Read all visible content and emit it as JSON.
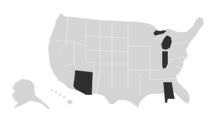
{
  "map": {
    "type": "US states choropleth",
    "colors": {
      "base": "#d4d4d4",
      "highlight": "#2f2f2f",
      "background": "#ffffff"
    },
    "highlighted_states": [
      "Arizona",
      "Michigan",
      "Indiana",
      "Alabama"
    ],
    "insets": [
      "Alaska",
      "Hawaii"
    ]
  }
}
